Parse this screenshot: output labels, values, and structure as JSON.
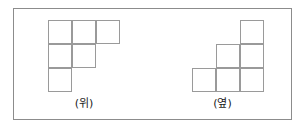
{
  "figure": {
    "background_color": "#ffffff",
    "frame_border_color": "#8c8c8c",
    "grid_line_color": "#9a9a9a",
    "cell_size_px": 24,
    "panels": [
      {
        "id": "top-view",
        "label": "(위)",
        "grid": {
          "rows": 3,
          "cols": 3,
          "filled": [
            [
              true,
              true,
              true
            ],
            [
              true,
              true,
              false
            ],
            [
              true,
              false,
              false
            ]
          ],
          "cell_count": 6
        }
      },
      {
        "id": "side-view",
        "label": "(옆)",
        "grid": {
          "rows": 3,
          "cols": 3,
          "filled": [
            [
              false,
              false,
              true
            ],
            [
              false,
              true,
              true
            ],
            [
              true,
              true,
              true
            ]
          ],
          "cell_count": 6
        }
      }
    ]
  }
}
